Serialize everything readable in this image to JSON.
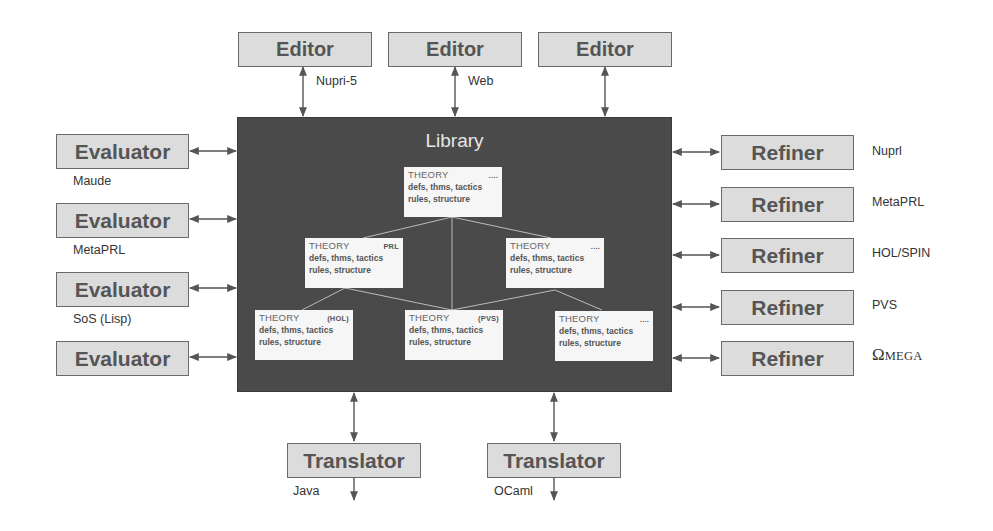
{
  "library": {
    "title": "Library"
  },
  "editors": [
    {
      "label": "Editor",
      "sublabel": "Nupri-5"
    },
    {
      "label": "Editor",
      "sublabel": "Web"
    },
    {
      "label": "Editor",
      "sublabel": ""
    }
  ],
  "evaluators": [
    {
      "label": "Evaluator",
      "sublabel": "Maude"
    },
    {
      "label": "Evaluator",
      "sublabel": "MetaPRL"
    },
    {
      "label": "Evaluator",
      "sublabel": "SoS (Lisp)"
    },
    {
      "label": "Evaluator",
      "sublabel": ""
    }
  ],
  "refiners": [
    {
      "label": "Refiner",
      "sublabel": "Nuprl"
    },
    {
      "label": "Refiner",
      "sublabel": "MetaPRL"
    },
    {
      "label": "Refiner",
      "sublabel": "HOL/SPIN"
    },
    {
      "label": "Refiner",
      "sublabel": "PVS"
    },
    {
      "label": "Refiner",
      "sublabel_omega": "Ω",
      "sublabel_rest": "MEGA"
    }
  ],
  "translators": [
    {
      "label": "Translator",
      "sublabel": "Java"
    },
    {
      "label": "Translator",
      "sublabel": "OCaml"
    }
  ],
  "theories": [
    {
      "title": "THEORY",
      "tag": "....",
      "line1": "defs, thms, tactics",
      "line2": "rules, structure"
    },
    {
      "title": "THEORY",
      "tag": "PRL",
      "line1": "defs, thms, tactics",
      "line2": "rules, structure"
    },
    {
      "title": "THEORY",
      "tag": "....",
      "line1": "defs, thms, tactics",
      "line2": "rules, structure"
    },
    {
      "title": "THEORY",
      "tag": "(HOL)",
      "line1": "defs, thms, tactics",
      "line2": "rules, structure"
    },
    {
      "title": "THEORY",
      "tag": "(PVS)",
      "line1": "defs, thms, tactics",
      "line2": "rules, structure"
    },
    {
      "title": "THEORY",
      "tag": "....",
      "line1": "defs, thms, tactics",
      "line2": "rules, structure"
    }
  ],
  "colors": {
    "library_bg": "#4a4a4a",
    "component_bg": "#dcdcdc",
    "component_border": "#6a6a6a",
    "theory_bg": "#f6f6f6"
  }
}
